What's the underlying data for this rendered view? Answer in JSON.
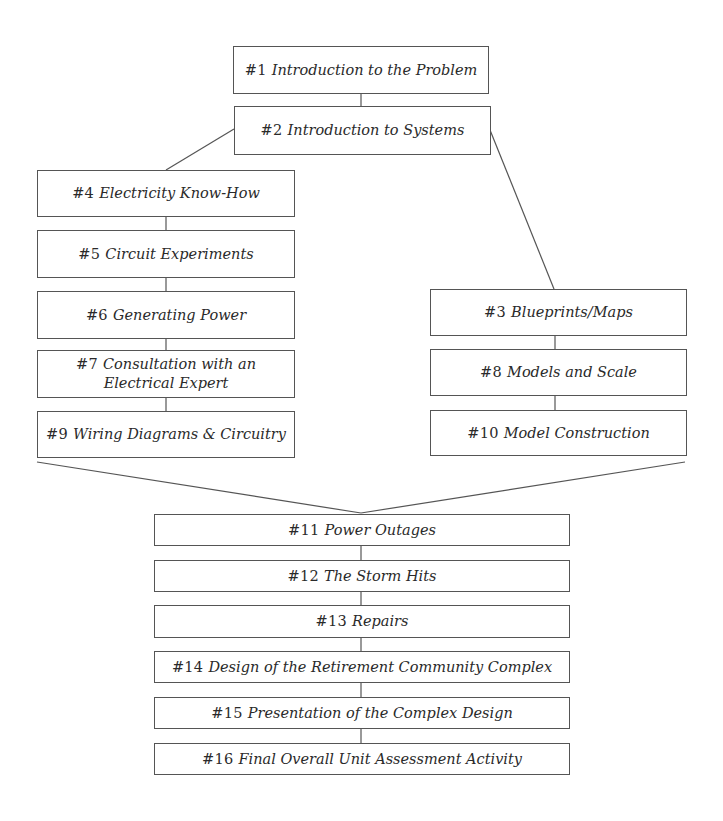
{
  "diagram": {
    "type": "unit-activity-flowchart",
    "nodes": [
      {
        "id": "1",
        "num": "#1",
        "title": "Introduction to the Problem"
      },
      {
        "id": "2",
        "num": "#2",
        "title": "Introduction to Systems"
      },
      {
        "id": "3",
        "num": "#3",
        "title": "Blueprints/Maps"
      },
      {
        "id": "4",
        "num": "#4",
        "title": "Electricity Know-How"
      },
      {
        "id": "5",
        "num": "#5",
        "title": "Circuit Experiments"
      },
      {
        "id": "6",
        "num": "#6",
        "title": "Generating Power"
      },
      {
        "id": "7",
        "num": "#7",
        "title": "Consultation with an Electrical Expert"
      },
      {
        "id": "8",
        "num": "#8",
        "title": "Models and Scale"
      },
      {
        "id": "9",
        "num": "#9",
        "title": "Wiring Diagrams & Circuitry"
      },
      {
        "id": "10",
        "num": "#10",
        "title": "Model Construction"
      },
      {
        "id": "11",
        "num": "#11",
        "title": "Power Outages"
      },
      {
        "id": "12",
        "num": "#12",
        "title": "The Storm Hits"
      },
      {
        "id": "13",
        "num": "#13",
        "title": "Repairs"
      },
      {
        "id": "14",
        "num": "#14",
        "title": "Design of the Retirement Community Complex"
      },
      {
        "id": "15",
        "num": "#15",
        "title": "Presentation of the Complex Design"
      },
      {
        "id": "16",
        "num": "#16",
        "title": "Final Overall Unit Assessment Activity"
      }
    ],
    "edges": [
      [
        "1",
        "2"
      ],
      [
        "2",
        "4"
      ],
      [
        "2",
        "3"
      ],
      [
        "4",
        "5"
      ],
      [
        "5",
        "6"
      ],
      [
        "6",
        "7"
      ],
      [
        "7",
        "9"
      ],
      [
        "3",
        "8"
      ],
      [
        "8",
        "10"
      ],
      [
        "9",
        "11"
      ],
      [
        "10",
        "11"
      ],
      [
        "11",
        "12"
      ],
      [
        "12",
        "13"
      ],
      [
        "13",
        "14"
      ],
      [
        "14",
        "15"
      ],
      [
        "15",
        "16"
      ]
    ],
    "colors": {
      "border": "#555555",
      "text": "#2a2a2a",
      "background": "#ffffff"
    }
  }
}
